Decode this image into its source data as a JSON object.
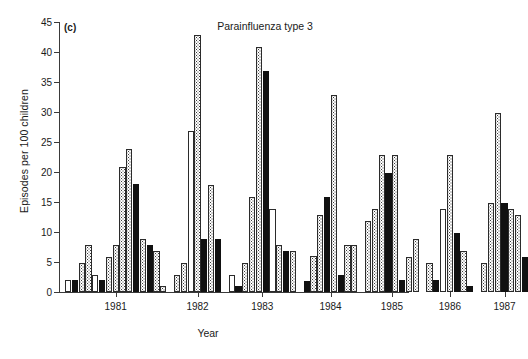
{
  "figure": {
    "panel_letter": "(c)",
    "title": "Parainfluenza type 3",
    "xlabel": "Year",
    "ylabel": "Episodes per 100 children"
  },
  "chart_data": {
    "type": "bar",
    "title": "Parainfluenza type 3",
    "panel_letter": "(c)",
    "xlabel": "Year",
    "ylabel": "Episodes per 100 children",
    "ylim": [
      0,
      45
    ],
    "ytick_step": 5,
    "yticks": [
      0,
      5,
      10,
      15,
      20,
      25,
      30,
      35,
      40,
      45
    ],
    "grid": false,
    "legend_position": "none",
    "categories": [
      "1981",
      "1982",
      "1983",
      "1984",
      "1985",
      "1986",
      "1987"
    ],
    "series_fill_patterns": [
      "open",
      "stipple",
      "solid"
    ],
    "bars": [
      {
        "year": "1981",
        "index": 0,
        "value": 2.0,
        "fill": "open"
      },
      {
        "year": "1981",
        "index": 1,
        "value": 2.0,
        "fill": "solid"
      },
      {
        "year": "1981",
        "index": 2,
        "value": 4.9,
        "fill": "stipple"
      },
      {
        "year": "1981",
        "index": 3,
        "value": 7.9,
        "fill": "stipple"
      },
      {
        "year": "1981",
        "index": 4,
        "value": 2.9,
        "fill": "open"
      },
      {
        "year": "1981",
        "index": 5,
        "value": 2.0,
        "fill": "solid"
      },
      {
        "year": "1981",
        "index": 6,
        "value": 5.8,
        "fill": "stipple"
      },
      {
        "year": "1981",
        "index": 7,
        "value": 7.9,
        "fill": "stipple"
      },
      {
        "year": "1981",
        "index": 8,
        "value": 20.9,
        "fill": "stipple"
      },
      {
        "year": "1981",
        "index": 9,
        "value": 23.9,
        "fill": "stipple"
      },
      {
        "year": "1981",
        "index": 10,
        "value": 18.0,
        "fill": "solid"
      },
      {
        "year": "1981",
        "index": 11,
        "value": 8.8,
        "fill": "stipple"
      },
      {
        "year": "1981",
        "index": 12,
        "value": 7.9,
        "fill": "solid"
      },
      {
        "year": "1981",
        "index": 13,
        "value": 6.9,
        "fill": "stipple"
      },
      {
        "year": "1981",
        "index": 14,
        "value": 1.0,
        "fill": "stipple"
      },
      {
        "year": "1982",
        "index": 0,
        "value": 2.9,
        "fill": "stipple"
      },
      {
        "year": "1982",
        "index": 1,
        "value": 4.9,
        "fill": "stipple"
      },
      {
        "year": "1982",
        "index": 2,
        "value": 26.8,
        "fill": "open"
      },
      {
        "year": "1982",
        "index": 3,
        "value": 42.8,
        "fill": "stipple"
      },
      {
        "year": "1982",
        "index": 4,
        "value": 8.8,
        "fill": "solid"
      },
      {
        "year": "1982",
        "index": 5,
        "value": 17.8,
        "fill": "stipple"
      },
      {
        "year": "1982",
        "index": 6,
        "value": 8.8,
        "fill": "solid"
      },
      {
        "year": "1983",
        "index": 0,
        "value": 2.9,
        "fill": "open"
      },
      {
        "year": "1983",
        "index": 1,
        "value": 1.0,
        "fill": "solid"
      },
      {
        "year": "1983",
        "index": 2,
        "value": 4.8,
        "fill": "stipple"
      },
      {
        "year": "1983",
        "index": 3,
        "value": 15.8,
        "fill": "stipple"
      },
      {
        "year": "1983",
        "index": 4,
        "value": 40.8,
        "fill": "stipple"
      },
      {
        "year": "1983",
        "index": 5,
        "value": 36.8,
        "fill": "solid"
      },
      {
        "year": "1983",
        "index": 6,
        "value": 13.8,
        "fill": "open"
      },
      {
        "year": "1983",
        "index": 7,
        "value": 7.8,
        "fill": "stipple"
      },
      {
        "year": "1983",
        "index": 8,
        "value": 6.8,
        "fill": "solid"
      },
      {
        "year": "1983",
        "index": 9,
        "value": 6.8,
        "fill": "stipple"
      },
      {
        "year": "1984",
        "index": 0,
        "value": 1.8,
        "fill": "solid"
      },
      {
        "year": "1984",
        "index": 1,
        "value": 6.0,
        "fill": "stipple"
      },
      {
        "year": "1984",
        "index": 2,
        "value": 12.8,
        "fill": "stipple"
      },
      {
        "year": "1984",
        "index": 3,
        "value": 15.8,
        "fill": "solid"
      },
      {
        "year": "1984",
        "index": 4,
        "value": 32.9,
        "fill": "stipple"
      },
      {
        "year": "1984",
        "index": 5,
        "value": 2.8,
        "fill": "solid"
      },
      {
        "year": "1984",
        "index": 6,
        "value": 7.8,
        "fill": "stipple"
      },
      {
        "year": "1984",
        "index": 7,
        "value": 7.8,
        "fill": "stipple"
      },
      {
        "year": "1985",
        "index": 0,
        "value": 11.8,
        "fill": "stipple"
      },
      {
        "year": "1985",
        "index": 1,
        "value": 13.8,
        "fill": "stipple"
      },
      {
        "year": "1985",
        "index": 2,
        "value": 22.8,
        "fill": "stipple"
      },
      {
        "year": "1985",
        "index": 3,
        "value": 19.8,
        "fill": "solid"
      },
      {
        "year": "1985",
        "index": 4,
        "value": 22.8,
        "fill": "stipple"
      },
      {
        "year": "1985",
        "index": 5,
        "value": 2.0,
        "fill": "solid"
      },
      {
        "year": "1985",
        "index": 6,
        "value": 5.8,
        "fill": "stipple"
      },
      {
        "year": "1985",
        "index": 7,
        "value": 8.8,
        "fill": "stipple"
      },
      {
        "year": "1986",
        "index": 0,
        "value": 4.8,
        "fill": "stipple"
      },
      {
        "year": "1986",
        "index": 1,
        "value": 2.0,
        "fill": "solid"
      },
      {
        "year": "1986",
        "index": 2,
        "value": 13.8,
        "fill": "open"
      },
      {
        "year": "1986",
        "index": 3,
        "value": 22.8,
        "fill": "stipple"
      },
      {
        "year": "1986",
        "index": 4,
        "value": 9.8,
        "fill": "solid"
      },
      {
        "year": "1986",
        "index": 5,
        "value": 6.8,
        "fill": "stipple"
      },
      {
        "year": "1986",
        "index": 6,
        "value": 1.0,
        "fill": "solid"
      },
      {
        "year": "1987",
        "index": 0,
        "value": 4.9,
        "fill": "stipple"
      },
      {
        "year": "1987",
        "index": 1,
        "value": 14.8,
        "fill": "stipple"
      },
      {
        "year": "1987",
        "index": 2,
        "value": 29.8,
        "fill": "stipple"
      },
      {
        "year": "1987",
        "index": 3,
        "value": 14.8,
        "fill": "solid"
      },
      {
        "year": "1987",
        "index": 4,
        "value": 13.8,
        "fill": "stipple"
      },
      {
        "year": "1987",
        "index": 5,
        "value": 12.8,
        "fill": "stipple"
      },
      {
        "year": "1987",
        "index": 6,
        "value": 5.8,
        "fill": "solid"
      }
    ]
  },
  "layout": {
    "plot_left": 59,
    "plot_top": 22,
    "plot_width": 350,
    "plot_height": 270,
    "bar_width": 6.2,
    "bar_gap": 0.6,
    "group_gap": 7,
    "year_tick_x": [
      92,
      143,
      192,
      245,
      294,
      340,
      384
    ]
  }
}
